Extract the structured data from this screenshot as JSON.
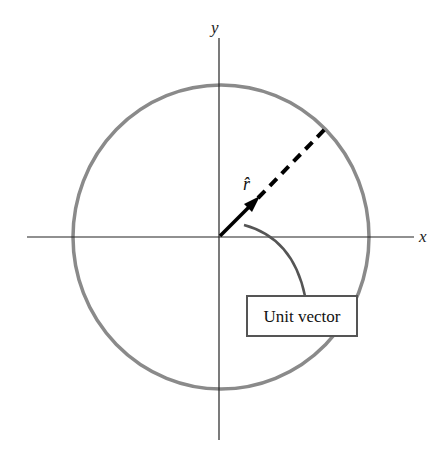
{
  "diagram": {
    "axes": {
      "x_label": "x",
      "y_label": "y"
    },
    "vector_label": "r̂",
    "callout_label": "Unit vector",
    "colors": {
      "circle": "#8a8a8a",
      "axis": "#222222",
      "vector": "#000000",
      "callout": "#555555"
    }
  }
}
